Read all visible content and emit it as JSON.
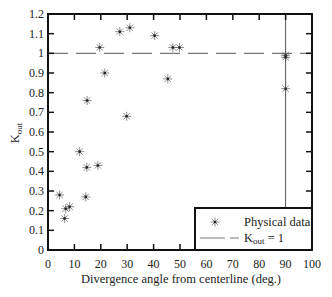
{
  "chart_data": {
    "type": "scatter",
    "title": "",
    "xlabel": "Divergence angle from centerline (deg.)",
    "ylabel": "K",
    "ylabel_sub": "out",
    "xlim": [
      0,
      100
    ],
    "ylim": [
      0,
      1.2
    ],
    "xticks": [
      0,
      10,
      20,
      30,
      40,
      50,
      60,
      70,
      80,
      90,
      100
    ],
    "yticks": [
      0,
      0.1,
      0.2,
      0.3,
      0.4,
      0.5,
      0.6,
      0.7,
      0.8,
      0.9,
      1,
      1.1,
      1.2
    ],
    "xtick_labels": [
      "0",
      "10",
      "20",
      "30",
      "40",
      "50",
      "60",
      "70",
      "80",
      "90",
      "100"
    ],
    "ytick_labels": [
      "0",
      "0.1",
      "0.2",
      "0.3",
      "0.4",
      "0.5",
      "0.6",
      "0.7",
      "0.8",
      "0.9",
      "1",
      "1.1",
      "1.2"
    ],
    "grid": false,
    "legend_position": "lower right",
    "series": [
      {
        "name": "Physical data",
        "marker": "asterisk",
        "color": "#555555",
        "points": [
          [
            4.4,
            0.28
          ],
          [
            6.3,
            0.16
          ],
          [
            6.7,
            0.21
          ],
          [
            8.2,
            0.22
          ],
          [
            12.0,
            0.5
          ],
          [
            14.3,
            0.27
          ],
          [
            14.7,
            0.42
          ],
          [
            14.8,
            0.76
          ],
          [
            18.9,
            0.43
          ],
          [
            19.6,
            1.03
          ],
          [
            21.5,
            0.9
          ],
          [
            27.2,
            1.11
          ],
          [
            29.8,
            0.68
          ],
          [
            31.0,
            1.13
          ],
          [
            40.4,
            1.09
          ],
          [
            45.4,
            0.87
          ],
          [
            47.3,
            1.03
          ],
          [
            49.8,
            1.03
          ],
          [
            90.0,
            0.99
          ],
          [
            90.0,
            0.98
          ],
          [
            90.0,
            0.82
          ]
        ]
      },
      {
        "name": "K_out = 1",
        "legend_main": "K",
        "legend_sub": "out",
        "legend_rest": " = 1",
        "style": "dashed",
        "color": "#777777",
        "y": 1
      }
    ],
    "annotations": [
      {
        "type": "vertical-line",
        "x": 90,
        "from_y": 0,
        "to_y": 1.2,
        "color": "#555555"
      }
    ]
  }
}
